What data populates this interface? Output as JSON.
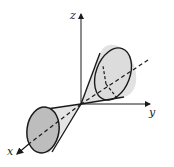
{
  "figure": {
    "axes": {
      "x_label": "x",
      "y_label": "y",
      "z_label": "z"
    },
    "colors": {
      "stroke": "#1a1a1a",
      "upper_cone_fill": "#dcdcdc",
      "lower_cone_fill": "#bdbdbd",
      "lower_cone_side": "#e4e4e4"
    }
  }
}
